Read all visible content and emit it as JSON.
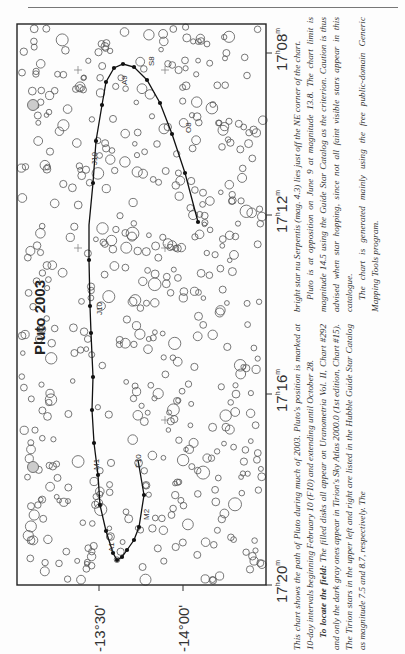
{
  "chart_data": {
    "type": "scatter",
    "title": "Pluto 2003",
    "orientation": "rotated 90° counter-clockwise (north to the left)",
    "xlabel": "Right Ascension",
    "ylabel": "Declination",
    "ra_ticks": [
      "17h08m",
      "17h12m",
      "17h16m",
      "17h20m"
    ],
    "dec_ticks": [
      "-13°30'",
      "-14°00'"
    ],
    "grid": false,
    "path_label_dates": [
      "F10",
      "M1",
      "M2",
      "A1",
      "A9",
      "J10",
      "J10",
      "S8",
      "O8"
    ],
    "path_description": "Pluto position marked at 10-day intervals from February 10 (F10) to October 28",
    "path_points_px": [
      [
        138,
        460
      ],
      [
        144,
        495
      ],
      [
        139,
        527
      ],
      [
        134,
        540
      ],
      [
        127,
        550
      ],
      [
        122,
        557
      ],
      [
        117,
        560
      ],
      [
        113,
        553
      ],
      [
        106,
        531
      ],
      [
        100,
        505
      ],
      [
        98,
        475
      ],
      [
        94,
        443
      ],
      [
        92,
        410
      ],
      [
        93,
        377
      ],
      [
        91,
        333
      ],
      [
        90,
        306
      ],
      [
        89,
        260
      ],
      [
        89,
        225
      ],
      [
        93,
        183
      ],
      [
        96,
        141
      ],
      [
        102,
        105
      ],
      [
        106,
        82
      ],
      [
        114,
        68
      ],
      [
        123,
        64
      ],
      [
        134,
        67
      ],
      [
        147,
        80
      ],
      [
        160,
        103
      ],
      [
        172,
        134
      ],
      [
        185,
        173
      ],
      [
        198,
        222
      ]
    ],
    "filled_marker_px": [
      [
        144,
        495
      ],
      [
        139,
        527
      ],
      [
        134,
        540
      ],
      [
        127,
        550
      ],
      [
        122,
        557
      ],
      [
        117,
        560
      ],
      [
        113,
        553
      ],
      [
        106,
        531
      ],
      [
        100,
        505
      ],
      [
        98,
        475
      ],
      [
        94,
        443
      ],
      [
        92,
        410
      ],
      [
        93,
        377
      ],
      [
        91,
        333
      ],
      [
        90,
        306
      ],
      [
        89,
        260
      ],
      [
        93,
        183
      ],
      [
        96,
        141
      ],
      [
        102,
        105
      ],
      [
        106,
        82
      ],
      [
        114,
        68
      ],
      [
        123,
        64
      ],
      [
        134,
        67
      ],
      [
        147,
        80
      ],
      [
        160,
        103
      ],
      [
        172,
        134
      ],
      [
        185,
        173
      ],
      [
        198,
        222
      ]
    ],
    "bright_gray_stars_px": [
      [
        33,
        105
      ],
      [
        33,
        467
      ]
    ],
    "crosshairs_px": [
      [
        78,
        70
      ],
      [
        78,
        248
      ],
      [
        165,
        248
      ],
      [
        165,
        420
      ],
      [
        165,
        70
      ]
    ]
  },
  "header": {
    "rule": true
  },
  "axes": {
    "ra": [
      {
        "label_h": "17",
        "label_m": "08",
        "y": 53
      },
      {
        "label_h": "17",
        "label_m": "12",
        "y": 215
      },
      {
        "label_h": "17",
        "label_m": "16",
        "y": 394
      },
      {
        "label_h": "17",
        "label_m": "20",
        "y": 585
      }
    ],
    "dec": [
      {
        "label": "-13°30'",
        "x": 99
      },
      {
        "label": "-14°00'",
        "x": 183
      }
    ]
  },
  "title": "Pluto 2003",
  "path_labels": [
    {
      "text": "F10",
      "x": 141,
      "y": 468
    },
    {
      "text": "M1",
      "x": 99,
      "y": 470
    },
    {
      "text": "M2",
      "x": 149,
      "y": 520
    },
    {
      "text": "A1",
      "x": 114,
      "y": 552
    },
    {
      "text": "A9",
      "x": 127,
      "y": 85
    },
    {
      "text": "J10",
      "x": 97,
      "y": 165
    },
    {
      "text": "J10",
      "x": 102,
      "y": 315
    },
    {
      "text": "S8",
      "x": 154,
      "y": 66
    },
    {
      "text": "O8",
      "x": 191,
      "y": 133
    }
  ],
  "caption": {
    "col1_p1": "This chart shows the path of Pluto during much of 2003. Pluto's position is marked at 10-day intervals beginning February 10 (F10) and extending until October 28.",
    "col1_p2_lead": "To locate the field:",
    "col1_p2": " The filled disks all appear on Uranometria Vol. II, Chart #292 and only the dark gray ones appear in Tirion's Sky Atlas 2000.0 (1st edition, Chart #15). The Tirion stars in the upper left and right are listed in the Hubble Guide Star Catalog as magnitude 7.5 and 8.7, respectively. The",
    "col2_p1": "bright star nu Serpentis (mag. 4.3) lies just off the NE corner of the chart.",
    "col2_p2": "Pluto is at opposition on June 9 at magnitude 13.8. The chart limit is magnitude 14.5 using the Guide Star Catalog as the criterion. Caution is thus advised when star hopping, since not all faint visible stars appear in this catalogue.",
    "col2_p3": "The chart is generated mainly using the free public-domain Generic Mapping Tools program."
  }
}
